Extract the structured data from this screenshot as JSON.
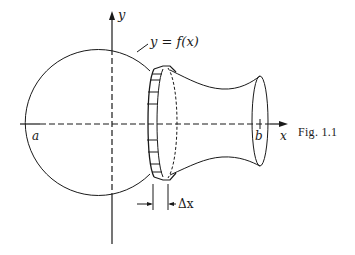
{
  "figure": {
    "caption": "Fig. 1.1",
    "curve_label": "y = f(x)",
    "axis_labels": {
      "x": "x",
      "y": "y"
    },
    "point_labels": {
      "a": "a",
      "b": "b"
    },
    "increment_label": "Δx"
  },
  "colors": {
    "ink": "#1a1a1a",
    "background": "#ffffff"
  }
}
